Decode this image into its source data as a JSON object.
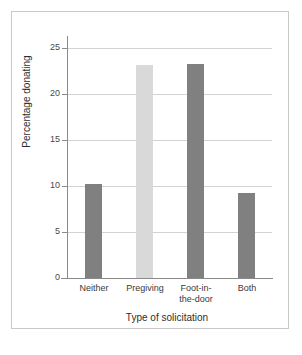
{
  "chart_data": {
    "type": "bar",
    "title": "",
    "xlabel": "Type of solicitation",
    "ylabel": "Percentage donating",
    "categories": [
      "Neither",
      "Pregiving",
      "Foot-in-the-door",
      "Both"
    ],
    "category_lines": [
      [
        "Neither"
      ],
      [
        "Pregiving"
      ],
      [
        "Foot-in-",
        "the-door"
      ],
      [
        "Both"
      ]
    ],
    "values": [
      10.2,
      23.2,
      23.3,
      9.3
    ],
    "bar_colors": [
      "#808080",
      "#d9d9d9",
      "#808080",
      "#808080"
    ],
    "yticks": [
      0,
      5,
      10,
      15,
      20,
      25
    ],
    "ytick_labels": [
      "0",
      "5",
      "10",
      "15",
      "20",
      "25"
    ],
    "ylim": [
      0,
      25.9
    ],
    "grid": true,
    "grid_axis": "y",
    "legend": false,
    "legend_position": "none"
  },
  "figure": {
    "background_color": "#ffffff",
    "frame_color": "#c9c9c9",
    "axis_color": "#8a8a8a",
    "gridline_color": "#d2d2d2"
  }
}
